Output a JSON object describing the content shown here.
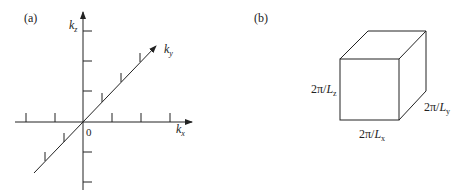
{
  "panel_a": {
    "label": "(a)",
    "axes": {
      "kx": {
        "label": "k",
        "subscript": "x"
      },
      "ky": {
        "label": "k",
        "subscript": "y"
      },
      "kz": {
        "label": "k",
        "subscript": "z"
      },
      "origin": "0"
    }
  },
  "panel_b": {
    "label": "(b)",
    "edges": {
      "x": {
        "prefix": "2π/",
        "var": "L",
        "subscript": "x"
      },
      "y": {
        "prefix": "2π/",
        "var": "L",
        "subscript": "y"
      },
      "z": {
        "prefix": "2π/",
        "var": "L",
        "subscript": "z"
      }
    }
  },
  "colors": {
    "line": "#222222",
    "background": "#ffffff"
  }
}
